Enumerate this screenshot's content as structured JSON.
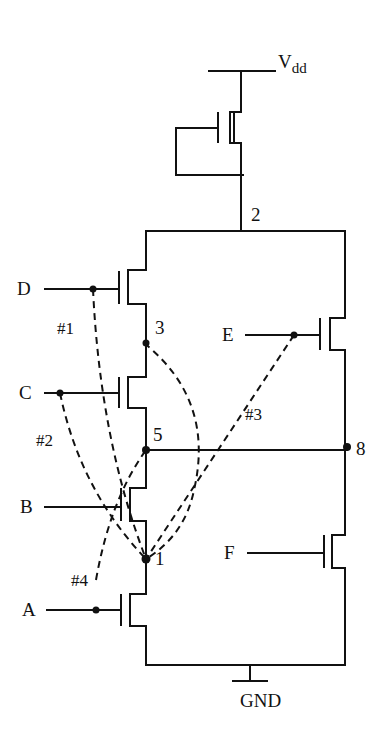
{
  "diagram": {
    "type": "cmos-transistor-schematic",
    "supply": {
      "label_main": "V",
      "label_sub": "dd"
    },
    "ground": {
      "label": "GND"
    },
    "inputs": [
      {
        "id": "A",
        "label": "A"
      },
      {
        "id": "B",
        "label": "B"
      },
      {
        "id": "C",
        "label": "C"
      },
      {
        "id": "D",
        "label": "D"
      },
      {
        "id": "E",
        "label": "E"
      },
      {
        "id": "F",
        "label": "F"
      }
    ],
    "nodes": [
      {
        "id": "1",
        "label": "1"
      },
      {
        "id": "2",
        "label": "2"
      },
      {
        "id": "3",
        "label": "3"
      },
      {
        "id": "5",
        "label": "5"
      },
      {
        "id": "8",
        "label": "8"
      }
    ],
    "faults": [
      {
        "id": "#1",
        "label": "#1",
        "from": "D",
        "to": "1"
      },
      {
        "id": "#2",
        "label": "#2",
        "from": "C",
        "to": "1"
      },
      {
        "id": "#3",
        "label": "#3",
        "from": "E",
        "to": "1"
      },
      {
        "id": "#4",
        "label": "#4",
        "from": "A",
        "to": "5"
      }
    ],
    "extra_bridge": {
      "from": "3",
      "to": "1"
    },
    "colors": {
      "stroke": "#111111",
      "background": "#ffffff"
    }
  }
}
